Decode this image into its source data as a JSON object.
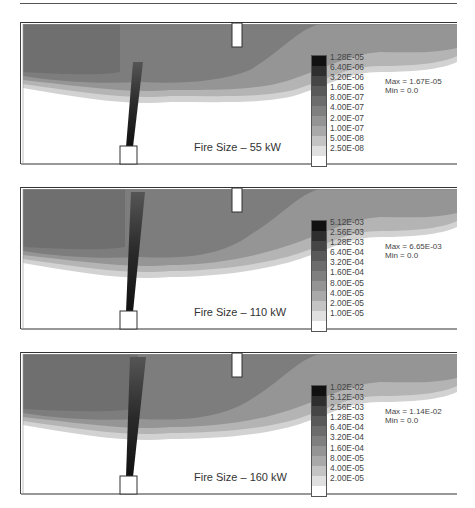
{
  "figure": {
    "panels": [
      {
        "caption": "Fire Size – 55 kW",
        "max_label": "Max = 1.67E-05",
        "min_label": "Min = 0.0",
        "legend_levels": [
          "1.28E-05",
          "6.40E-06",
          "3.20E-06",
          "1.60E-06",
          "8.00E-07",
          "4.00E-07",
          "2.00E-07",
          "1.00E-07",
          "5.00E-08",
          "2.50E-08"
        ]
      },
      {
        "caption": "Fire Size – 110 kW",
        "max_label": "Max = 6.65E-03",
        "min_label": "Min = 0.0",
        "legend_levels": [
          "5.12E-03",
          "2.56E-03",
          "1.28E-03",
          "6.40E-04",
          "3.20E-04",
          "1.60E-04",
          "8.00E-05",
          "4.00E-05",
          "2.00E-05",
          "1.00E-05"
        ]
      },
      {
        "caption": "Fire Size – 160 kW",
        "max_label": "Max = 1.14E-02",
        "min_label": "Min = 0.0",
        "legend_levels": [
          "1.02E-02",
          "5.12E-03",
          "2.56E-03",
          "1.28E-03",
          "6.40E-04",
          "3.20E-04",
          "1.60E-04",
          "8.00E-05",
          "4.00E-05",
          "2.00E-05"
        ]
      }
    ],
    "legend_colors": [
      "#111111",
      "#2e2e2e",
      "#454545",
      "#595959",
      "#6c6c6c",
      "#7f7f7f",
      "#949494",
      "#a9a9a9",
      "#c4c4c4",
      "#e0e0e0",
      "#ffffff"
    ],
    "layer_colors": {
      "dark_layer": "#6f6f6f",
      "mid_layer": "#7d7d7d",
      "light_layer": "#959595",
      "pale_layer": "#b4b4b4",
      "fringe": "#d2d2d2",
      "plume_core": "#1a1a1a"
    }
  }
}
